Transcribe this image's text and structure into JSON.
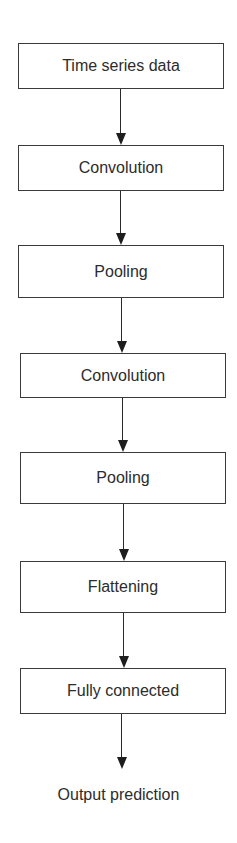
{
  "diagram": {
    "nodes": [
      {
        "id": "n1",
        "label": "Time series data"
      },
      {
        "id": "n2",
        "label": "Convolution"
      },
      {
        "id": "n3",
        "label": "Pooling"
      },
      {
        "id": "n4",
        "label": "Convolution"
      },
      {
        "id": "n5",
        "label": "Pooling"
      },
      {
        "id": "n6",
        "label": "Flattening"
      },
      {
        "id": "n7",
        "label": "Fully connected"
      }
    ],
    "output": {
      "label": "Output prediction"
    },
    "edges": [
      [
        "n1",
        "n2"
      ],
      [
        "n2",
        "n3"
      ],
      [
        "n3",
        "n4"
      ],
      [
        "n4",
        "n5"
      ],
      [
        "n5",
        "n6"
      ],
      [
        "n6",
        "n7"
      ],
      [
        "n7",
        "output"
      ]
    ],
    "colors": {
      "stroke": "#3a3a3a",
      "text": "#2c2c2c",
      "background": "#ffffff"
    }
  }
}
